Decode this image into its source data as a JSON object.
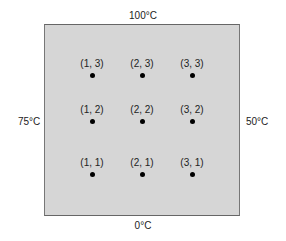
{
  "diagram": {
    "type": "heat-plate-grid",
    "boundary_temperatures": {
      "top": "100°C",
      "bottom": "0°C",
      "left": "75°C",
      "right": "50°C"
    },
    "colors": {
      "plate_fill": "#d6d6d6",
      "plate_border": "#777777",
      "dot": "#000000"
    },
    "nodes": [
      {
        "label": "(1, 3)",
        "i": 1,
        "j": 3
      },
      {
        "label": "(2, 3)",
        "i": 2,
        "j": 3
      },
      {
        "label": "(3, 3)",
        "i": 3,
        "j": 3
      },
      {
        "label": "(1, 2)",
        "i": 1,
        "j": 2
      },
      {
        "label": "(2, 2)",
        "i": 2,
        "j": 2
      },
      {
        "label": "(3, 2)",
        "i": 3,
        "j": 2
      },
      {
        "label": "(1, 1)",
        "i": 1,
        "j": 1
      },
      {
        "label": "(2, 1)",
        "i": 2,
        "j": 1
      },
      {
        "label": "(3, 1)",
        "i": 3,
        "j": 1
      }
    ]
  }
}
